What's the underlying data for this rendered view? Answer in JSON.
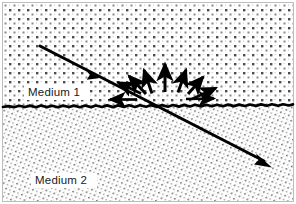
{
  "figure": {
    "width": 296,
    "height": 204,
    "background_color": "#ffffff",
    "border_color": "#b8b8b8",
    "ink_color": "#000000"
  },
  "labels": {
    "medium_1": "Medium 1",
    "medium_2": "Medium 2"
  },
  "media": {
    "upper": {
      "name": "Medium 1",
      "texture": "coarse-square-dot-grid",
      "dot_color": "#555555",
      "region_y": [
        3,
        106
      ]
    },
    "lower": {
      "name": "Medium 2",
      "texture": "fine-diagonal-dot-grid",
      "dot_color": "#777777",
      "region_y": [
        106,
        201
      ]
    }
  },
  "interface": {
    "name": "rough-boundary",
    "nominal_y": 106,
    "stroke_width": 2.6,
    "roughness_amplitude": 2.5
  },
  "rays": {
    "incident": {
      "name": "incident-ray",
      "from": [
        40,
        46
      ],
      "to": [
        157,
        106
      ],
      "mid_arrow_at": [
        93,
        75
      ],
      "stroke_width": 3.0
    },
    "transmitted": {
      "name": "transmitted-ray",
      "from": [
        157,
        106
      ],
      "to": [
        270,
        164
      ],
      "stroke_width": 3.0
    }
  },
  "scatter_point": [
    157,
    106
  ],
  "scattered_arrows": [
    {
      "name": "scattered-arrow-left-horizontal",
      "angle_deg": 180,
      "start_radius": 22,
      "length": 30,
      "width": 2.6
    },
    {
      "name": "scattered-arrow-upper-left-shallow",
      "angle_deg": 155,
      "start_radius": 18,
      "length": 30,
      "width": 2.8
    },
    {
      "name": "scattered-arrow-upper-left",
      "angle_deg": 133,
      "start_radius": 14,
      "length": 30,
      "width": 3.0
    },
    {
      "name": "scattered-arrow-upper-left-steep",
      "angle_deg": 112,
      "start_radius": 12,
      "length": 32,
      "width": 3.0
    },
    {
      "name": "scattered-arrow-normal",
      "angle_deg": 90,
      "start_radius": 12,
      "length": 35,
      "width": 3.0
    },
    {
      "name": "scattered-arrow-upper-right-steep",
      "angle_deg": 68,
      "start_radius": 12,
      "length": 32,
      "width": 3.0
    },
    {
      "name": "scattered-arrow-upper-right",
      "angle_deg": 47,
      "start_radius": 14,
      "length": 30,
      "width": 3.0
    },
    {
      "name": "scattered-arrow-upper-right-shallow",
      "angle_deg": 25,
      "start_radius": 18,
      "length": 28,
      "width": 2.8
    },
    {
      "name": "scattered-arrow-right-horizontal",
      "angle_deg": 2,
      "start_radius": 28,
      "length": 30,
      "width": 2.6
    }
  ]
}
